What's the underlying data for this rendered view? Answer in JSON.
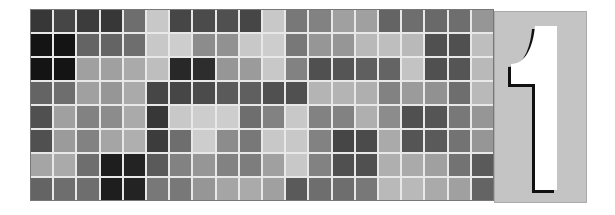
{
  "figure": {
    "grid_rows": 8,
    "grid_cols": 20,
    "gray_levels": [
      [
        55,
        70,
        60,
        55,
        110,
        200,
        70,
        75,
        80,
        70,
        200,
        120,
        130,
        160,
        160,
        100,
        110,
        105,
        110,
        150
      ],
      [
        20,
        20,
        100,
        100,
        110,
        200,
        205,
        140,
        145,
        200,
        205,
        120,
        150,
        150,
        185,
        190,
        185,
        80,
        80,
        190
      ],
      [
        20,
        20,
        160,
        160,
        170,
        190,
        40,
        45,
        150,
        155,
        200,
        130,
        80,
        85,
        95,
        100,
        195,
        80,
        85,
        185
      ],
      [
        100,
        110,
        160,
        150,
        170,
        70,
        70,
        75,
        90,
        95,
        80,
        80,
        180,
        180,
        175,
        130,
        155,
        145,
        110,
        185
      ],
      [
        80,
        160,
        130,
        140,
        170,
        55,
        200,
        205,
        205,
        110,
        130,
        200,
        130,
        130,
        175,
        140,
        80,
        85,
        120,
        150
      ],
      [
        80,
        155,
        130,
        165,
        175,
        60,
        110,
        205,
        140,
        120,
        200,
        200,
        130,
        70,
        75,
        170,
        85,
        90,
        115,
        150
      ],
      [
        165,
        170,
        110,
        30,
        35,
        90,
        130,
        150,
        130,
        125,
        160,
        200,
        130,
        80,
        80,
        175,
        170,
        160,
        115,
        90
      ],
      [
        100,
        110,
        110,
        30,
        35,
        120,
        120,
        150,
        165,
        170,
        160,
        90,
        110,
        110,
        120,
        185,
        185,
        170,
        160,
        100
      ]
    ],
    "panel_numeral": "1",
    "panel_color": "#c4c4c4"
  }
}
